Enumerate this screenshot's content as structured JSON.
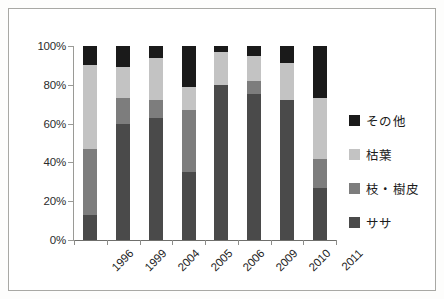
{
  "chart_data": {
    "type": "bar",
    "stacked": true,
    "normalized": true,
    "title": "",
    "subtitle": "",
    "xlabel": "",
    "ylabel": "",
    "categories": [
      "1996",
      "1999",
      "2004",
      "2005",
      "2006",
      "2009",
      "2010",
      "2011"
    ],
    "ytick_labels": [
      "0%",
      "20%",
      "40%",
      "60%",
      "80%",
      "100%"
    ],
    "ytick_values": [
      0,
      20,
      40,
      60,
      80,
      100
    ],
    "ylim": [
      0,
      100
    ],
    "grid": false,
    "legend_position": "right",
    "series": [
      {
        "name": "その他",
        "color": "#1a1a1a",
        "values": [
          10,
          11,
          6,
          21,
          3,
          5,
          9,
          27
        ]
      },
      {
        "name": "枯葉",
        "color": "#c3c3c3",
        "values": [
          43,
          16,
          22,
          12,
          17,
          13,
          19,
          31
        ]
      },
      {
        "name": "枝・樹皮",
        "color": "#7d7d7d",
        "values": [
          34,
          13,
          9,
          32,
          0,
          7,
          0,
          15
        ]
      },
      {
        "name": "ササ",
        "color": "#4a4a4a",
        "values": [
          13,
          60,
          63,
          35,
          80,
          75,
          72,
          27
        ]
      }
    ],
    "stack_order_top_to_bottom": [
      "その他",
      "枯葉",
      "枝・樹皮",
      "ササ"
    ]
  },
  "legend": {
    "items": [
      {
        "label": "その他",
        "color": "#1a1a1a"
      },
      {
        "label": "枯葉",
        "color": "#c3c3c3"
      },
      {
        "label": "枝・樹皮",
        "color": "#7d7d7d"
      },
      {
        "label": "ササ",
        "color": "#4a4a4a"
      }
    ]
  },
  "colors": {
    "sonota": "#1a1a1a",
    "kareha": "#c3c3c3",
    "eda_juhi": "#7d7d7d",
    "sasa": "#4a4a4a",
    "axis": "#8d8d8a",
    "frame": "#a8a8a4",
    "text": "#1c1c1c",
    "background": "#ffffff"
  }
}
